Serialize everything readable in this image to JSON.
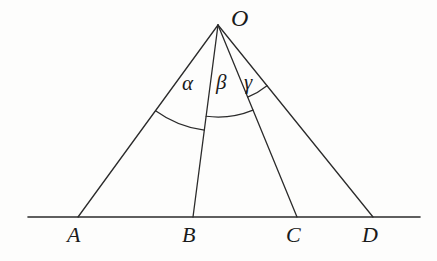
{
  "figure": {
    "background_color": "#fdfdfc",
    "stroke_color": "#2b2b2b",
    "baseline": {
      "y": 217,
      "x_start": 28,
      "x_end": 420
    },
    "apex": {
      "name": "O",
      "label": "O",
      "x": 218,
      "y": 25,
      "label_x": 231,
      "label_y": 6
    },
    "points": [
      {
        "name": "A",
        "label": "A",
        "x": 78,
        "y": 217,
        "label_x": 67,
        "label_y": 224
      },
      {
        "name": "B",
        "label": "B",
        "x": 193,
        "y": 217,
        "label_x": 182,
        "label_y": 224
      },
      {
        "name": "C",
        "label": "C",
        "x": 297,
        "y": 217,
        "label_x": 286,
        "label_y": 224
      },
      {
        "name": "D",
        "label": "D",
        "x": 373,
        "y": 217,
        "label_x": 362,
        "label_y": 224
      }
    ],
    "rays": [
      {
        "name": "ray-OA",
        "from": "O",
        "to": "A"
      },
      {
        "name": "ray-OB",
        "from": "O",
        "to": "B"
      },
      {
        "name": "ray-OC",
        "from": "O",
        "to": "C"
      },
      {
        "name": "ray-OD",
        "from": "O",
        "to": "D"
      }
    ],
    "angles": [
      {
        "name": "alpha",
        "label": "α",
        "between": [
          "OA",
          "OB"
        ],
        "arc_radius": 106,
        "label_x": 182,
        "label_y": 73
      },
      {
        "name": "beta",
        "label": "β",
        "between": [
          "OB",
          "OC"
        ],
        "arc_radius": 92,
        "label_x": 216,
        "label_y": 72
      },
      {
        "name": "gamma",
        "label": "γ",
        "between": [
          "OC",
          "OD"
        ],
        "arc_radius": 78,
        "label_x": 244,
        "label_y": 72
      }
    ]
  }
}
